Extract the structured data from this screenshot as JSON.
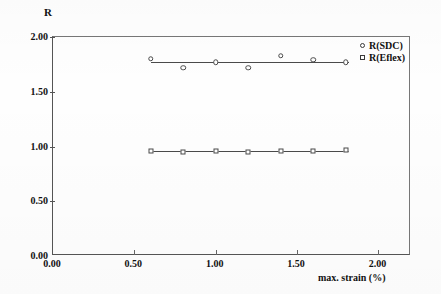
{
  "chart_data": {
    "type": "scatter",
    "title": "",
    "xlabel": "max. strain (%)",
    "ylabel": "R",
    "xlim": [
      0.0,
      2.2
    ],
    "ylim": [
      0.0,
      2.0
    ],
    "xticks": [
      "0.00",
      "0.50",
      "1.00",
      "1.50",
      "2.00"
    ],
    "xtick_values": [
      0.0,
      0.5,
      1.0,
      1.5,
      2.0
    ],
    "yticks": [
      "0.00",
      "0.50",
      "1.00",
      "1.50",
      "2.00"
    ],
    "ytick_values": [
      0.0,
      0.5,
      1.0,
      1.5,
      2.0
    ],
    "grid": false,
    "legend_position": "top-right",
    "series": [
      {
        "name": "R(SDC)",
        "marker": "open-circle",
        "x": [
          0.6,
          0.8,
          1.0,
          1.2,
          1.4,
          1.6,
          1.8
        ],
        "values": [
          1.8,
          1.72,
          1.77,
          1.72,
          1.83,
          1.79,
          1.77
        ],
        "trend_y": 1.77,
        "trend_x_start": 0.6,
        "trend_x_end": 1.82
      },
      {
        "name": "R(Eflex)",
        "marker": "open-square",
        "x": [
          0.6,
          0.8,
          1.0,
          1.2,
          1.4,
          1.6,
          1.8
        ],
        "values": [
          0.96,
          0.95,
          0.96,
          0.95,
          0.96,
          0.96,
          0.97
        ],
        "trend_y": 0.96,
        "trend_x_start": 0.6,
        "trend_x_end": 1.82
      }
    ]
  },
  "legend": {
    "entries": [
      {
        "label": "R(SDC)",
        "marker": "open-circle"
      },
      {
        "label": "R(Eflex)",
        "marker": "open-square"
      }
    ]
  },
  "colors": {
    "axis": "#555555",
    "series_line": "#4a4a4a",
    "text": "#111111",
    "background": "#ffffff"
  }
}
